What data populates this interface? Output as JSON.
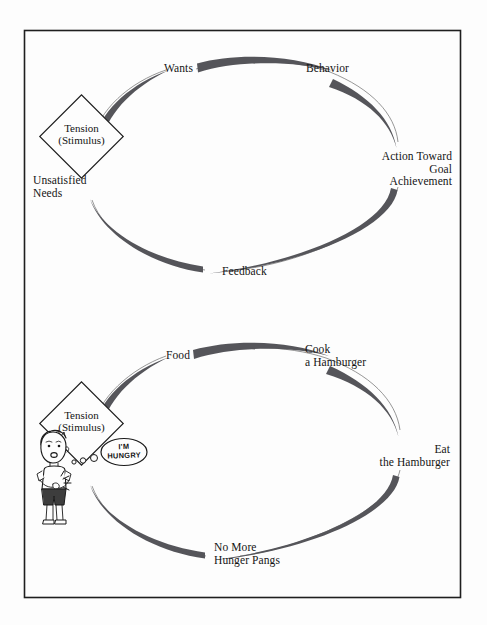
{
  "page": {
    "background_color": "#fdfdfd",
    "border_color": "#1f1f1f",
    "arc_color": "#55555a",
    "thin_line_color": "#5a5a5a"
  },
  "top_cycle": {
    "name": "motivation-cycle-generic",
    "diamond": {
      "line1": "Tension",
      "line2": "(Stimulus)"
    },
    "nodes": [
      {
        "id": "wants",
        "label": "Wants",
        "align": "right"
      },
      {
        "id": "behavior",
        "label": "Behavior",
        "align": "left"
      },
      {
        "id": "action-goal",
        "label": "Action Toward\nGoal\nAchievement",
        "align": "right"
      },
      {
        "id": "feedback",
        "label": "Feedback",
        "align": "left"
      },
      {
        "id": "unsatisfied-needs",
        "label": "Unsatisfied\nNeeds",
        "align": "left"
      }
    ]
  },
  "bottom_cycle": {
    "name": "motivation-cycle-hamburger-example",
    "diamond": {
      "line1": "Tension",
      "line2": "(Stimulus)"
    },
    "speech_bubble": {
      "line1": "I'M",
      "line2": "HUNGRY"
    },
    "character": "boy-holding-stomach",
    "nodes": [
      {
        "id": "food",
        "label": "Food",
        "align": "right"
      },
      {
        "id": "cook-hamburger",
        "label": "Cook\na Hamburger",
        "align": "left"
      },
      {
        "id": "eat-hamburger",
        "label": "Eat\nthe Hamburger",
        "align": "right"
      },
      {
        "id": "no-hunger",
        "label": "No More\nHunger Pangs",
        "align": "left"
      }
    ]
  }
}
